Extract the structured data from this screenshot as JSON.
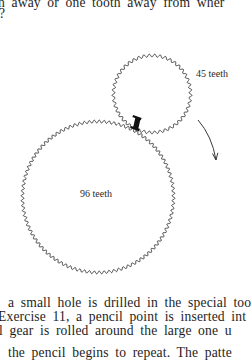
{
  "page": {
    "text_above_figure": [
      "h away or one tooth away from wher",
      "?"
    ],
    "text_below_figure": [
      "a small hole is drilled in the special too",
      "Exercise 11, a pencil point is inserted int",
      "l gear is rolled around the large one u",
      "the pencil begins to repeat. The patte"
    ]
  },
  "figure": {
    "small_gear": {
      "teeth": 45,
      "label": "45 teeth"
    },
    "large_gear": {
      "teeth": 96,
      "label": "96 teeth"
    },
    "contact_marker": "tooth-mark",
    "rotation_arrow": "clockwise"
  },
  "colors": {
    "ink": "#3a3a3a",
    "text": "#1e1e1e",
    "marker": "#111111",
    "background": "#ffffff"
  }
}
